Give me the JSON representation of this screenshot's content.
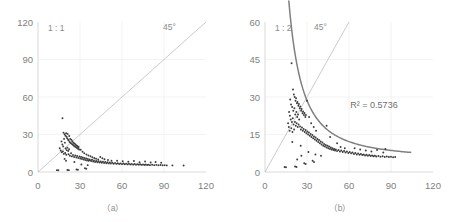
{
  "figure": {
    "background": "#ffffff",
    "axis_color": "#cfcfcf",
    "grid_color": "#eeeeee",
    "point_color": "#3a3a3a",
    "diagonal_color": "#b4b4b4",
    "fit_color": "#808080"
  },
  "chart_data": [
    {
      "type": "scatter",
      "panel": "a",
      "caption": "（a）",
      "title": "",
      "xlabel": "",
      "ylabel": "",
      "ratio_label": "1 : 1",
      "diagonal_label": "45°",
      "xlim": [
        0,
        120
      ],
      "ylim": [
        0,
        120
      ],
      "xticks": [
        0,
        30,
        60,
        90,
        120
      ],
      "yticks": [
        0,
        30,
        60,
        90,
        120
      ],
      "xticklabels": [
        "0",
        "30",
        "60",
        "90",
        "120"
      ],
      "yticklabels": [
        "0",
        "30",
        "60",
        "90",
        "120"
      ],
      "grid": true,
      "legend": "none",
      "reference_line": {
        "type": "identity",
        "from": [
          0,
          0
        ],
        "to": [
          120,
          120
        ],
        "label": "45°"
      },
      "points": [
        [
          17.5,
          43.0
        ],
        [
          18.2,
          31.5
        ],
        [
          19.0,
          30.2
        ],
        [
          19.6,
          29.0
        ],
        [
          20.1,
          31.0
        ],
        [
          20.4,
          28.2
        ],
        [
          20.8,
          27.0
        ],
        [
          21.2,
          30.5
        ],
        [
          21.5,
          26.0
        ],
        [
          21.9,
          25.2
        ],
        [
          22.3,
          28.8
        ],
        [
          22.6,
          24.0
        ],
        [
          23.0,
          26.5
        ],
        [
          23.4,
          23.2
        ],
        [
          23.8,
          25.8
        ],
        [
          24.1,
          22.5
        ],
        [
          24.5,
          24.6
        ],
        [
          24.9,
          21.8
        ],
        [
          25.2,
          23.4
        ],
        [
          25.6,
          21.0
        ],
        [
          26.0,
          22.8
        ],
        [
          26.4,
          20.4
        ],
        [
          26.8,
          22.0
        ],
        [
          27.1,
          19.8
        ],
        [
          27.5,
          21.2
        ],
        [
          27.9,
          19.2
        ],
        [
          28.3,
          20.6
        ],
        [
          28.6,
          18.6
        ],
        [
          29.0,
          20.0
        ],
        [
          29.4,
          18.0
        ],
        [
          16.8,
          24.5
        ],
        [
          17.4,
          22.0
        ],
        [
          18.0,
          20.5
        ],
        [
          18.6,
          26.5
        ],
        [
          19.2,
          23.5
        ],
        [
          19.8,
          18.8
        ],
        [
          20.5,
          17.5
        ],
        [
          21.0,
          19.5
        ],
        [
          21.6,
          16.8
        ],
        [
          22.2,
          18.2
        ],
        [
          15.5,
          19.0
        ],
        [
          16.2,
          17.2
        ],
        [
          17.0,
          15.8
        ],
        [
          17.8,
          16.5
        ],
        [
          18.4,
          14.5
        ],
        [
          19.4,
          15.2
        ],
        [
          20.2,
          13.8
        ],
        [
          21.8,
          14.2
        ],
        [
          22.8,
          13.0
        ],
        [
          23.6,
          15.0
        ],
        [
          24.2,
          12.5
        ],
        [
          25.0,
          13.6
        ],
        [
          25.8,
          12.0
        ],
        [
          26.6,
          13.2
        ],
        [
          27.4,
          11.6
        ],
        [
          28.0,
          12.8
        ],
        [
          28.8,
          11.2
        ],
        [
          29.6,
          12.4
        ],
        [
          30.2,
          10.8
        ],
        [
          30.8,
          12.0
        ],
        [
          31.4,
          10.4
        ],
        [
          32.0,
          11.6
        ],
        [
          32.6,
          10.0
        ],
        [
          33.2,
          11.2
        ],
        [
          33.8,
          9.6
        ],
        [
          34.4,
          10.8
        ],
        [
          35.0,
          9.2
        ],
        [
          35.6,
          10.4
        ],
        [
          36.2,
          9.0
        ],
        [
          36.8,
          10.0
        ],
        [
          30.5,
          17.8
        ],
        [
          31.8,
          16.2
        ],
        [
          33.0,
          15.0
        ],
        [
          34.6,
          14.0
        ],
        [
          36.0,
          13.2
        ],
        [
          37.5,
          12.6
        ],
        [
          38.8,
          11.8
        ],
        [
          40.2,
          11.2
        ],
        [
          41.5,
          10.6
        ],
        [
          43.0,
          10.0
        ],
        [
          37.2,
          9.4
        ],
        [
          38.0,
          8.8
        ],
        [
          38.6,
          9.8
        ],
        [
          39.4,
          8.4
        ],
        [
          40.0,
          9.2
        ],
        [
          40.8,
          8.0
        ],
        [
          41.6,
          8.8
        ],
        [
          42.4,
          7.8
        ],
        [
          43.2,
          8.6
        ],
        [
          44.0,
          7.6
        ],
        [
          44.8,
          8.4
        ],
        [
          45.6,
          7.4
        ],
        [
          46.4,
          8.2
        ],
        [
          47.2,
          7.2
        ],
        [
          48.0,
          8.0
        ],
        [
          48.8,
          7.0
        ],
        [
          49.6,
          7.8
        ],
        [
          50.4,
          6.9
        ],
        [
          51.2,
          7.6
        ],
        [
          52.0,
          6.8
        ],
        [
          44.5,
          12.0
        ],
        [
          46.0,
          11.0
        ],
        [
          47.5,
          10.2
        ],
        [
          50.0,
          9.6
        ],
        [
          52.5,
          9.0
        ],
        [
          53.0,
          7.4
        ],
        [
          54.0,
          6.6
        ],
        [
          55.0,
          7.2
        ],
        [
          56.0,
          6.5
        ],
        [
          57.0,
          7.0
        ],
        [
          58.0,
          6.4
        ],
        [
          59.0,
          6.9
        ],
        [
          60.0,
          6.3
        ],
        [
          61.0,
          6.8
        ],
        [
          62.0,
          6.2
        ],
        [
          63.0,
          6.7
        ],
        [
          64.0,
          6.1
        ],
        [
          65.0,
          6.6
        ],
        [
          66.0,
          6.0
        ],
        [
          67.0,
          6.5
        ],
        [
          68.0,
          5.9
        ],
        [
          69.0,
          6.4
        ],
        [
          70.0,
          5.8
        ],
        [
          71.0,
          6.3
        ],
        [
          72.0,
          5.8
        ],
        [
          73.0,
          6.2
        ],
        [
          74.0,
          5.7
        ],
        [
          75.0,
          6.1
        ],
        [
          76.0,
          5.6
        ],
        [
          77.0,
          6.0
        ],
        [
          78.0,
          5.6
        ],
        [
          79.0,
          5.9
        ],
        [
          80.0,
          5.5
        ],
        [
          81.5,
          5.8
        ],
        [
          83.0,
          5.5
        ],
        [
          84.5,
          5.7
        ],
        [
          86.0,
          5.4
        ],
        [
          87.5,
          5.6
        ],
        [
          89.0,
          5.4
        ],
        [
          90.5,
          5.5
        ],
        [
          56.5,
          9.0
        ],
        [
          60.5,
          8.6
        ],
        [
          64.5,
          8.2
        ],
        [
          68.5,
          8.8
        ],
        [
          72.5,
          7.8
        ],
        [
          76.5,
          8.4
        ],
        [
          80.5,
          7.6
        ],
        [
          84.0,
          8.0
        ],
        [
          88.0,
          7.4
        ],
        [
          92.0,
          5.3
        ],
        [
          104.0,
          5.2
        ],
        [
          96.0,
          5.3
        ],
        [
          13.5,
          1.5
        ],
        [
          14.5,
          1.4
        ],
        [
          21.0,
          1.6
        ],
        [
          22.0,
          1.5
        ],
        [
          27.5,
          2.0
        ],
        [
          28.5,
          1.8
        ],
        [
          33.5,
          3.0
        ],
        [
          34.5,
          2.6
        ],
        [
          19.0,
          10.5
        ],
        [
          20.0,
          9.0
        ],
        [
          26.0,
          8.0
        ],
        [
          31.0,
          6.0
        ],
        [
          35.5,
          5.5
        ]
      ]
    },
    {
      "type": "scatter",
      "panel": "b",
      "caption": "（b）",
      "title": "",
      "xlabel": "",
      "ylabel": "",
      "ratio_label": "1 : 2",
      "diagonal_label": "45°",
      "r2_label": "R² = 0.5736",
      "r2_value": 0.5736,
      "xlim": [
        0,
        120
      ],
      "ylim": [
        0,
        60
      ],
      "xticks": [
        0,
        30,
        60,
        90,
        120
      ],
      "yticks": [
        0,
        15,
        30,
        45,
        60
      ],
      "xticklabels": [
        "0",
        "30",
        "60",
        "90",
        "120"
      ],
      "yticklabels": [
        "0",
        "15",
        "30",
        "45",
        "60"
      ],
      "grid": true,
      "legend": "none",
      "reference_line": {
        "type": "identity",
        "from": [
          0,
          0
        ],
        "to": [
          60,
          60
        ],
        "label": "45°"
      },
      "fit_line": {
        "type": "power",
        "description": "descending power-law fit through cluster",
        "x_from": 17,
        "x_to": 104
      },
      "points": [
        [
          19.0,
          43.5
        ],
        [
          20.0,
          33.0
        ],
        [
          20.6,
          31.0
        ],
        [
          21.2,
          30.0
        ],
        [
          21.8,
          28.5
        ],
        [
          22.2,
          29.5
        ],
        [
          22.8,
          27.5
        ],
        [
          23.2,
          28.0
        ],
        [
          23.8,
          26.5
        ],
        [
          24.2,
          27.2
        ],
        [
          24.8,
          25.5
        ],
        [
          25.2,
          26.2
        ],
        [
          25.8,
          24.5
        ],
        [
          26.2,
          25.2
        ],
        [
          26.8,
          23.5
        ],
        [
          27.2,
          24.2
        ],
        [
          27.8,
          22.8
        ],
        [
          28.2,
          23.6
        ],
        [
          28.8,
          22.0
        ],
        [
          29.2,
          22.8
        ],
        [
          18.0,
          29.0
        ],
        [
          18.6,
          27.0
        ],
        [
          19.4,
          26.0
        ],
        [
          20.2,
          24.5
        ],
        [
          21.0,
          25.5
        ],
        [
          21.6,
          23.0
        ],
        [
          22.4,
          24.0
        ],
        [
          23.0,
          22.0
        ],
        [
          23.6,
          23.0
        ],
        [
          24.4,
          21.0
        ],
        [
          17.2,
          24.0
        ],
        [
          17.8,
          22.5
        ],
        [
          18.4,
          21.0
        ],
        [
          19.2,
          20.0
        ],
        [
          19.8,
          21.5
        ],
        [
          20.4,
          19.0
        ],
        [
          21.4,
          20.0
        ],
        [
          22.0,
          18.5
        ],
        [
          22.6,
          19.5
        ],
        [
          23.4,
          18.0
        ],
        [
          16.5,
          19.5
        ],
        [
          17.0,
          18.0
        ],
        [
          17.6,
          16.5
        ],
        [
          18.8,
          17.5
        ],
        [
          19.6,
          16.0
        ],
        [
          20.8,
          17.0
        ],
        [
          24.0,
          19.0
        ],
        [
          25.0,
          18.2
        ],
        [
          25.6,
          17.0
        ],
        [
          26.4,
          17.8
        ],
        [
          27.0,
          16.5
        ],
        [
          27.6,
          17.2
        ],
        [
          28.4,
          16.0
        ],
        [
          29.0,
          16.8
        ],
        [
          29.6,
          15.5
        ],
        [
          30.2,
          16.2
        ],
        [
          30.8,
          15.0
        ],
        [
          31.4,
          15.8
        ],
        [
          32.0,
          14.5
        ],
        [
          32.6,
          15.2
        ],
        [
          33.2,
          14.0
        ],
        [
          33.8,
          14.8
        ],
        [
          34.4,
          13.5
        ],
        [
          35.0,
          14.2
        ],
        [
          35.6,
          13.0
        ],
        [
          30.0,
          28.5
        ],
        [
          31.5,
          22.0
        ],
        [
          33.0,
          19.5
        ],
        [
          34.8,
          18.0
        ],
        [
          36.5,
          16.5
        ],
        [
          36.2,
          13.8
        ],
        [
          36.8,
          12.5
        ],
        [
          37.4,
          13.2
        ],
        [
          38.0,
          12.0
        ],
        [
          38.6,
          12.8
        ],
        [
          39.2,
          11.5
        ],
        [
          39.8,
          12.2
        ],
        [
          40.4,
          11.0
        ],
        [
          41.0,
          11.8
        ],
        [
          41.6,
          10.5
        ],
        [
          42.2,
          11.2
        ],
        [
          42.8,
          10.2
        ],
        [
          43.4,
          10.8
        ],
        [
          44.0,
          9.8
        ],
        [
          44.6,
          10.5
        ],
        [
          45.2,
          9.5
        ],
        [
          45.8,
          10.2
        ],
        [
          46.4,
          9.2
        ],
        [
          47.0,
          9.8
        ],
        [
          47.6,
          9.0
        ],
        [
          48.2,
          9.5
        ],
        [
          48.8,
          8.8
        ],
        [
          49.4,
          9.2
        ],
        [
          50.0,
          8.6
        ],
        [
          50.6,
          9.0
        ],
        [
          44.0,
          18.5
        ],
        [
          46.5,
          14.0
        ],
        [
          51.5,
          11.5
        ],
        [
          54.0,
          10.0
        ],
        [
          57.0,
          9.5
        ],
        [
          51.5,
          8.4
        ],
        [
          52.5,
          8.8
        ],
        [
          53.5,
          8.2
        ],
        [
          54.5,
          8.6
        ],
        [
          55.5,
          8.0
        ],
        [
          56.5,
          8.4
        ],
        [
          57.5,
          7.8
        ],
        [
          58.5,
          8.2
        ],
        [
          59.5,
          7.6
        ],
        [
          60.5,
          8.0
        ],
        [
          61.5,
          7.5
        ],
        [
          62.5,
          7.8
        ],
        [
          63.5,
          7.2
        ],
        [
          64.5,
          7.6
        ],
        [
          65.5,
          7.0
        ],
        [
          66.5,
          7.4
        ],
        [
          67.5,
          6.9
        ],
        [
          68.5,
          7.2
        ],
        [
          69.5,
          6.8
        ],
        [
          70.5,
          7.0
        ],
        [
          71.5,
          6.6
        ],
        [
          72.5,
          6.9
        ],
        [
          73.5,
          6.5
        ],
        [
          74.5,
          6.8
        ],
        [
          75.5,
          6.4
        ],
        [
          76.5,
          6.6
        ],
        [
          77.5,
          6.3
        ],
        [
          78.5,
          6.5
        ],
        [
          79.5,
          6.2
        ],
        [
          81.0,
          6.4
        ],
        [
          82.5,
          6.1
        ],
        [
          84.0,
          6.3
        ],
        [
          85.5,
          6.0
        ],
        [
          87.0,
          6.2
        ],
        [
          88.5,
          6.0
        ],
        [
          90.0,
          6.1
        ],
        [
          91.5,
          5.9
        ],
        [
          93.0,
          6.0
        ],
        [
          64.0,
          9.5
        ],
        [
          68.0,
          9.0
        ],
        [
          72.0,
          8.6
        ],
        [
          76.0,
          8.2
        ],
        [
          80.0,
          8.8
        ],
        [
          86.0,
          9.2
        ],
        [
          84.5,
          7.8
        ],
        [
          14.0,
          2.0
        ],
        [
          15.0,
          1.9
        ],
        [
          21.5,
          2.2
        ],
        [
          22.5,
          2.0
        ],
        [
          28.0,
          3.5
        ],
        [
          29.0,
          3.2
        ],
        [
          34.0,
          4.5
        ],
        [
          35.0,
          4.0
        ],
        [
          19.5,
          12.0
        ],
        [
          25.5,
          10.5
        ],
        [
          31.0,
          8.0
        ],
        [
          36.0,
          7.0
        ],
        [
          40.0,
          6.5
        ],
        [
          23.0,
          5.0
        ],
        [
          26.0,
          6.5
        ]
      ]
    }
  ]
}
